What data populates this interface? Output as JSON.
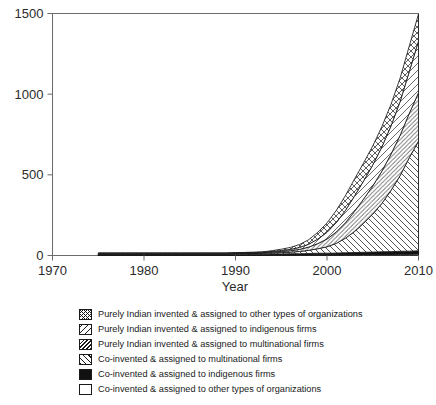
{
  "chart_data": {
    "type": "area",
    "stacked": true,
    "title": "",
    "subtitle": "",
    "xlabel": "Year",
    "ylabel": "",
    "xlim": [
      1970,
      2010
    ],
    "ylim": [
      0,
      1500
    ],
    "xticks": [
      1970,
      1980,
      1990,
      2000,
      2010
    ],
    "yticks": [
      0,
      500,
      1000,
      1500
    ],
    "xtick_labels": [
      "1970",
      "1980",
      "1990",
      "2000",
      "2010"
    ],
    "ytick_labels": [
      "0",
      "500",
      "1000",
      "1500"
    ],
    "grid": false,
    "legend_position": "below",
    "x": [
      1975,
      1976,
      1977,
      1978,
      1979,
      1980,
      1981,
      1982,
      1983,
      1984,
      1985,
      1986,
      1987,
      1988,
      1989,
      1990,
      1991,
      1992,
      1993,
      1994,
      1995,
      1996,
      1997,
      1998,
      1999,
      2000,
      2001,
      2002,
      2003,
      2004,
      2005,
      2006,
      2007,
      2008,
      2009,
      2010
    ],
    "series": [
      {
        "name": "Co-invented & assigned to other types of organizations",
        "pattern": "empty",
        "values": [
          2,
          2,
          2,
          2,
          2,
          2,
          2,
          2,
          2,
          2,
          2,
          2,
          2,
          2,
          2,
          2,
          2,
          2,
          2,
          3,
          3,
          3,
          3,
          3,
          4,
          4,
          4,
          5,
          5,
          6,
          6,
          7,
          7,
          8,
          8,
          9
        ]
      },
      {
        "name": "Co-invented & assigned to indigenous firms",
        "pattern": "solid-black",
        "values": [
          5,
          5,
          5,
          5,
          5,
          5,
          5,
          5,
          5,
          5,
          5,
          5,
          5,
          5,
          5,
          6,
          6,
          6,
          6,
          7,
          7,
          8,
          8,
          9,
          10,
          10,
          11,
          12,
          13,
          14,
          15,
          16,
          17,
          18,
          19,
          20
        ]
      },
      {
        "name": "Co-invented & assigned to multinational firms",
        "pattern": "back-diagonal",
        "values": [
          3,
          3,
          3,
          3,
          3,
          3,
          3,
          3,
          3,
          3,
          3,
          3,
          3,
          3,
          3,
          4,
          4,
          4,
          5,
          6,
          8,
          10,
          14,
          20,
          28,
          40,
          60,
          90,
          130,
          180,
          235,
          300,
          380,
          470,
          580,
          680
        ]
      },
      {
        "name": "Purely Indian invented & assigned to multinational firms",
        "pattern": "forward-diagonal-dense",
        "values": [
          2,
          2,
          2,
          2,
          2,
          2,
          2,
          2,
          2,
          2,
          2,
          2,
          2,
          2,
          2,
          2,
          3,
          3,
          4,
          5,
          7,
          9,
          13,
          20,
          32,
          48,
          70,
          95,
          125,
          150,
          175,
          200,
          225,
          250,
          275,
          300
        ]
      },
      {
        "name": "Purely Indian invented & assigned to indigenous firms",
        "pattern": "forward-diagonal-light",
        "values": [
          2,
          2,
          2,
          2,
          2,
          2,
          2,
          2,
          2,
          2,
          2,
          2,
          2,
          2,
          2,
          2,
          2,
          3,
          3,
          4,
          6,
          8,
          12,
          18,
          28,
          42,
          58,
          76,
          95,
          112,
          130,
          150,
          175,
          210,
          260,
          320
        ]
      },
      {
        "name": "Purely Indian invented & assigned to other types of organizations",
        "pattern": "crosshatch",
        "values": [
          2,
          2,
          2,
          2,
          2,
          2,
          2,
          2,
          2,
          2,
          2,
          2,
          2,
          2,
          2,
          2,
          2,
          3,
          3,
          5,
          8,
          12,
          18,
          28,
          42,
          58,
          75,
          92,
          105,
          112,
          118,
          126,
          134,
          145,
          158,
          168
        ]
      }
    ],
    "totals": [
      16,
      16,
      16,
      16,
      16,
      16,
      16,
      16,
      16,
      16,
      16,
      16,
      16,
      16,
      16,
      18,
      19,
      21,
      23,
      30,
      39,
      50,
      68,
      98,
      144,
      202,
      278,
      370,
      473,
      574,
      679,
      799,
      938,
      1101,
      1300,
      1497
    ]
  },
  "legend": {
    "items": [
      {
        "pattern": "crosshatch",
        "label": "Purely Indian invented & assigned to other types of organizations"
      },
      {
        "pattern": "forward-diagonal-light",
        "label": "Purely Indian invented & assigned to indigenous firms"
      },
      {
        "pattern": "forward-diagonal-dense",
        "label": "Purely Indian invented & assigned to multinational firms"
      },
      {
        "pattern": "back-diagonal",
        "label": "Co-invented & assigned to multinational firms"
      },
      {
        "pattern": "solid-black",
        "label": "Co-invented & assigned to indigenous firms"
      },
      {
        "pattern": "empty",
        "label": "Co-invented & assigned to other types of organizations"
      }
    ]
  },
  "colors": {
    "ink": "#1a1a1a",
    "axis": "#555555",
    "background": "#ffffff",
    "black_series": "#111111"
  }
}
